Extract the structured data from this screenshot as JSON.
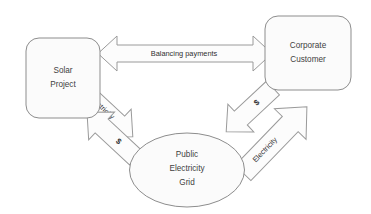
{
  "diagram": {
    "background_color": "#ffffff",
    "shape_fill": "#fbfbfb",
    "shape_stroke": "#8d8d8d",
    "arrow_fill": "#fcfcfc",
    "arrow_stroke": "#9a9a9a",
    "label_color": "#3f3f3f"
  },
  "nodes": [
    {
      "id": "solar-project",
      "shape": "rounded-rectangle",
      "lines": [
        "Solar",
        "Project"
      ],
      "line1": "Solar",
      "line2": "Project"
    },
    {
      "id": "corporate-customer",
      "shape": "rounded-rectangle",
      "lines": [
        "Corporate",
        "Customer"
      ],
      "line1": "Corporate",
      "line2": "Customer"
    },
    {
      "id": "public-electricity-grid",
      "shape": "ellipse",
      "lines": [
        "Public",
        "Electricity",
        "Grid"
      ],
      "line1": "Public",
      "line2": "Electricity",
      "line3": "Grid"
    }
  ],
  "arrows": [
    {
      "id": "balancing-payments",
      "label": "Balancing payments",
      "direction": "bidirectional",
      "orientation": "horizontal",
      "from": "solar-project",
      "to": "corporate-customer"
    },
    {
      "id": "solar-to-grid-electricity",
      "label": "Electricity",
      "direction": "unidirectional",
      "orientation": "diagonal-down-right",
      "from": "solar-project",
      "to": "public-electricity-grid"
    },
    {
      "id": "grid-to-solar-money",
      "label": "$",
      "direction": "unidirectional",
      "orientation": "diagonal-up-left",
      "from": "public-electricity-grid",
      "to": "solar-project"
    },
    {
      "id": "customer-to-grid-money",
      "label": "$",
      "direction": "unidirectional",
      "orientation": "diagonal-down-left",
      "from": "corporate-customer",
      "to": "public-electricity-grid"
    },
    {
      "id": "grid-to-customer-electricity",
      "label": "Electricity",
      "direction": "unidirectional",
      "orientation": "diagonal-up-right",
      "from": "public-electricity-grid",
      "to": "corporate-customer"
    }
  ]
}
